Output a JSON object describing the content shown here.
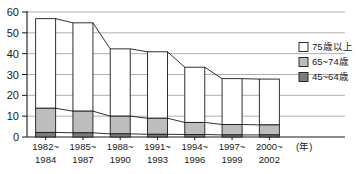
{
  "chart_data": {
    "type": "bar",
    "subtype": "stacked-column-with-connecting-lines",
    "title": "",
    "xlabel": "(年)",
    "ylabel": "",
    "ylim": [
      0,
      60
    ],
    "ytick_values": [
      0,
      10,
      20,
      30,
      40,
      50,
      60
    ],
    "ytick_labels": [
      "0",
      "10",
      "20",
      "30",
      "40",
      "50",
      "60"
    ],
    "grid": true,
    "grid_axis": "y",
    "legend_position": "right",
    "categories": [
      "1982~\n1984",
      "1985~\n1987",
      "1988~\n1990",
      "1991~\n1993",
      "1994~\n1996",
      "1997~\n1999",
      "2000~\n2002"
    ],
    "category_lines": [
      [
        "1982~",
        "1984"
      ],
      [
        "1985~",
        "1987"
      ],
      [
        "1988~",
        "1990"
      ],
      [
        "1991~",
        "1993"
      ],
      [
        "1994~",
        "1996"
      ],
      [
        "1997~",
        "1999"
      ],
      [
        "2000~",
        "2002"
      ]
    ],
    "series": [
      {
        "name": "45~64歳",
        "color": "#7d7d7d",
        "stack_order": 0,
        "values": [
          2.2,
          2.0,
          1.5,
          1.3,
          1.2,
          1.0,
          1.0
        ]
      },
      {
        "name": "65~74歳",
        "color": "#bdbdbd",
        "stack_order": 1,
        "values": [
          11.6,
          10.4,
          8.5,
          7.7,
          5.8,
          5.0,
          4.8
        ]
      },
      {
        "name": "75歳以上",
        "color": "#ffffff",
        "stack_order": 2,
        "values": [
          43.0,
          42.4,
          32.3,
          31.9,
          26.5,
          22.0,
          22.0
        ]
      }
    ],
    "cumulative_tops": [
      56.8,
      54.8,
      42.3,
      40.9,
      33.5,
      28.0,
      27.8
    ],
    "cumulative_mid_tops": [
      13.8,
      12.4,
      10.0,
      9.0,
      7.0,
      6.0,
      5.8
    ],
    "cumulative_low_tops": [
      2.2,
      2.0,
      1.5,
      1.3,
      1.2,
      1.0,
      1.0
    ]
  },
  "legend": {
    "items": [
      {
        "label": "75歳以上",
        "color": "#ffffff"
      },
      {
        "label": "65~74歳",
        "color": "#bdbdbd"
      },
      {
        "label": "45~64歳",
        "color": "#7d7d7d"
      }
    ]
  },
  "axis": {
    "x_unit_label": "(年)"
  }
}
